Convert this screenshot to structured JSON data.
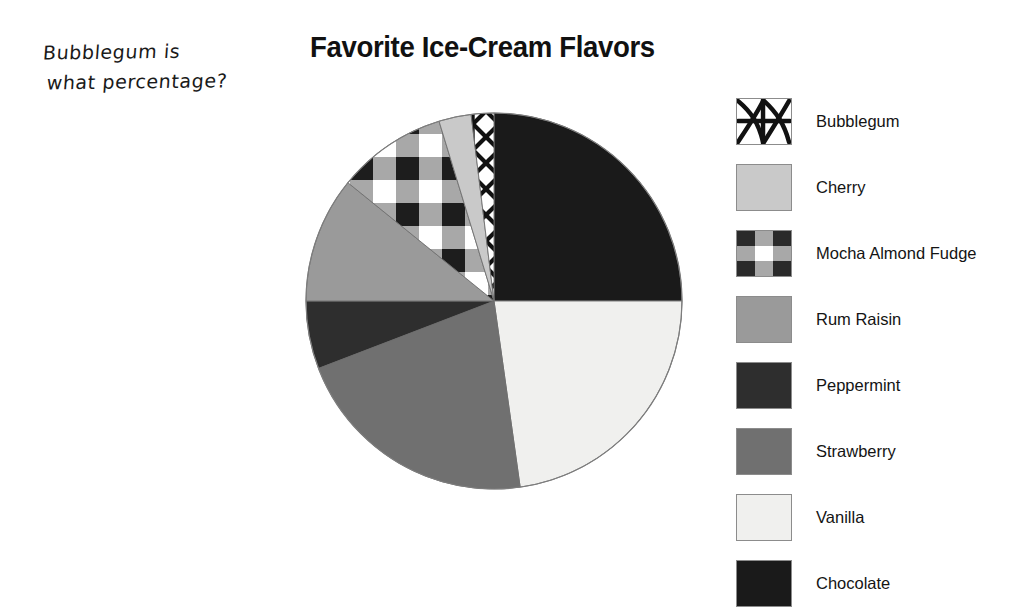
{
  "annotation": {
    "line1": "Bubblegum is",
    "line2": "what percentage?"
  },
  "chart_title": "Favorite Ice-Cream Flavors",
  "legend": {
    "items": [
      {
        "label": "Bubblegum",
        "swatch": "crosshatch-x-pattern",
        "color": "#ffffff"
      },
      {
        "label": "Cherry",
        "swatch": "solid-fill",
        "color": "#c9c9c9"
      },
      {
        "label": "Mocha Almond Fudge",
        "swatch": "checkered-plaid-pattern",
        "color": "#ffffff"
      },
      {
        "label": "Rum Raisin",
        "swatch": "solid-fill",
        "color": "#9a9a9a"
      },
      {
        "label": "Peppermint",
        "swatch": "solid-fill",
        "color": "#2e2e2e"
      },
      {
        "label": "Strawberry",
        "swatch": "solid-fill",
        "color": "#707070"
      },
      {
        "label": "Vanilla",
        "swatch": "solid-fill",
        "color": "#f0f0ee"
      },
      {
        "label": "Chocolate",
        "swatch": "solid-fill",
        "color": "#1a1a1a"
      }
    ]
  },
  "chart_data": {
    "type": "pie",
    "title": "Favorite Ice-Cream Flavors",
    "xlabel": "",
    "ylabel": "",
    "legend_position": "right",
    "grid": false,
    "start_angle_deg": 0,
    "direction": "clockwise",
    "center": {
      "x": 190,
      "y": 190
    },
    "radius": 188,
    "categories": [
      "Chocolate",
      "Vanilla",
      "Strawberry",
      "Peppermint",
      "Rum Raisin",
      "Mocha Almond Fudge",
      "Cherry",
      "Bubblegum"
    ],
    "values": [
      25.0,
      22.8,
      21.4,
      5.8,
      10.8,
      9.4,
      2.8,
      2.0
    ],
    "slices": [
      {
        "label": "Chocolate",
        "percent": 25.0,
        "start_deg": 0,
        "end_deg": 90,
        "fill": "#1a1a1a",
        "pattern": "solid-fill"
      },
      {
        "label": "Vanilla",
        "percent": 22.8,
        "start_deg": 90,
        "end_deg": 172,
        "fill": "#f0f0ee",
        "pattern": "solid-fill"
      },
      {
        "label": "Strawberry",
        "percent": 21.4,
        "start_deg": 172,
        "end_deg": 249,
        "fill": "#707070",
        "pattern": "solid-fill"
      },
      {
        "label": "Peppermint",
        "percent": 5.8,
        "start_deg": 249,
        "end_deg": 270,
        "fill": "#2e2e2e",
        "pattern": "solid-fill"
      },
      {
        "label": "Rum Raisin",
        "percent": 10.8,
        "start_deg": 270,
        "end_deg": 309,
        "fill": "#9a9a9a",
        "pattern": "solid-fill"
      },
      {
        "label": "Mocha Almond Fudge",
        "percent": 9.4,
        "start_deg": 309,
        "end_deg": 343,
        "fill": "#ffffff",
        "pattern": "checkered-plaid-pattern"
      },
      {
        "label": "Cherry",
        "percent": 2.8,
        "start_deg": 343,
        "end_deg": 353,
        "fill": "#c9c9c9",
        "pattern": "solid-fill"
      },
      {
        "label": "Bubblegum",
        "percent": 2.0,
        "start_deg": 353,
        "end_deg": 360,
        "fill": "#ffffff",
        "pattern": "crosshatch-x-pattern"
      }
    ]
  }
}
